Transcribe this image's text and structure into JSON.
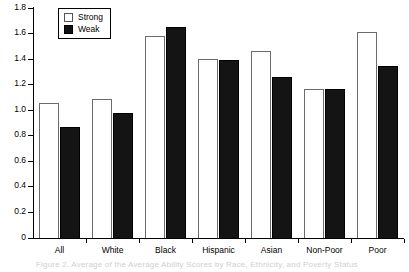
{
  "chart_data": {
    "type": "bar",
    "title": "",
    "xlabel": "",
    "ylabel": "",
    "ylim": [
      0,
      1.8
    ],
    "ytick_step": 0.2,
    "grid": false,
    "legend_position": "top-left-inside",
    "categories": [
      "All",
      "White",
      "Black",
      "Hispanic",
      "Asian",
      "Non-Poor",
      "Poor"
    ],
    "series": [
      {
        "name": "Strong",
        "color": "#ffffff",
        "edge_color": "#6b6b6b",
        "values": [
          1.06,
          1.09,
          1.58,
          1.4,
          1.46,
          1.17,
          1.61
        ]
      },
      {
        "name": "Weak",
        "color": "#141414",
        "edge_color": "#000000",
        "values": [
          0.87,
          0.98,
          1.65,
          1.39,
          1.26,
          1.17,
          1.35
        ]
      }
    ],
    "ytick_labels": [
      "0",
      "0.2",
      "0.4",
      "0.6",
      "0.8",
      "1.0",
      "1.2",
      "1.4",
      "1.6",
      "1.8"
    ],
    "ytick_values": [
      0,
      0.2,
      0.4,
      0.6,
      0.8,
      1.0,
      1.2,
      1.4,
      1.6,
      1.8
    ]
  },
  "legend": {
    "items": [
      {
        "label": "Strong",
        "swatch": "hollow-square-icon"
      },
      {
        "label": "Weak",
        "swatch": "filled-square-icon"
      }
    ]
  },
  "caption": {
    "clipped_text": "Figure 2.  Average of the Average Ability Scores by Race, Ethnicity, and Poverty Status"
  }
}
